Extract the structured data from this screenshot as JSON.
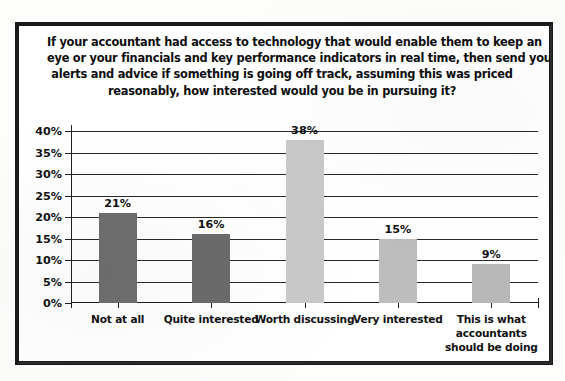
{
  "chart_data": {
    "type": "bar",
    "title_lines": [
      "If your accountant had access to technology that would enable them to keep an",
      "eye or your financials and key performance indicators in real time, then send you",
      "alerts and advice if something is going off track, assuming this was priced",
      "reasonably, how interested would you be in pursuing it?"
    ],
    "categories": [
      "Not at all",
      "Quite interested",
      "Worth discussing",
      "Very interested",
      "This is what accountants should be doing"
    ],
    "category_lines": [
      [
        "Not at all"
      ],
      [
        "Quite interested"
      ],
      [
        "Worth discussing"
      ],
      [
        "Very interested"
      ],
      [
        "This is what",
        "accountants",
        "should be doing"
      ]
    ],
    "values": [
      21,
      16,
      38,
      15,
      9
    ],
    "value_labels": [
      "21%",
      "16%",
      "38%",
      "15%",
      "9%"
    ],
    "bar_colors": [
      "#6e6e6e",
      "#6b6b6b",
      "#c9c9c9",
      "#bdbdbd",
      "#b8b8b8"
    ],
    "xlabel": "",
    "ylabel": "",
    "ylim": [
      0,
      40
    ],
    "ytick_values": [
      0,
      5,
      10,
      15,
      20,
      25,
      30,
      35,
      40
    ],
    "ytick_labels": [
      "0%",
      "5%",
      "10%",
      "15%",
      "20%",
      "25%",
      "30%",
      "35%",
      "40%"
    ],
    "grid": true,
    "grid_axis": "y",
    "legend": false,
    "units": "percent"
  },
  "colors": {
    "border": "#1a1a1a",
    "axis": "#1f1f1f",
    "gridline": "#2a2a2a",
    "text": "#111111",
    "background": "#ffffff"
  }
}
